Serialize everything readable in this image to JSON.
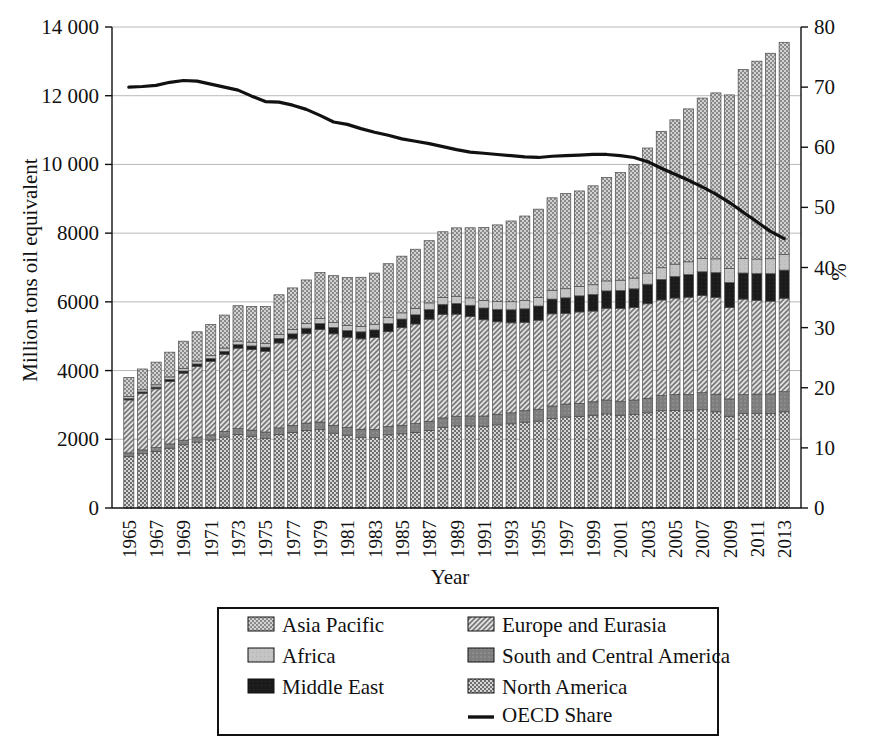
{
  "chart_data": {
    "type": "bar",
    "title": "",
    "subtitle": "",
    "xlabel": "Year",
    "ylabel": "Million tons oil equivalent",
    "y2label": "%",
    "grid": true,
    "legend_position": "bottom",
    "ylim": [
      0,
      14000
    ],
    "y2lim": [
      0,
      80
    ],
    "yticks": [
      "0",
      "2000",
      "4000",
      "6000",
      "8000",
      "10 000",
      "12 000",
      "14 000"
    ],
    "ytick_values": [
      0,
      2000,
      4000,
      6000,
      8000,
      10000,
      12000,
      14000
    ],
    "y2ticks": [
      "0",
      "10",
      "20",
      "30",
      "40",
      "50",
      "60",
      "70",
      "80"
    ],
    "y2tick_values": [
      0,
      10,
      20,
      30,
      40,
      50,
      60,
      70,
      80
    ],
    "x": [
      1965,
      1966,
      1967,
      1968,
      1969,
      1970,
      1971,
      1972,
      1973,
      1974,
      1975,
      1976,
      1977,
      1978,
      1979,
      1980,
      1981,
      1982,
      1983,
      1984,
      1985,
      1986,
      1987,
      1988,
      1989,
      1990,
      1991,
      1992,
      1993,
      1994,
      1995,
      1996,
      1997,
      1998,
      1999,
      2000,
      2001,
      2002,
      2003,
      2004,
      2005,
      2006,
      2007,
      2008,
      2009,
      2010,
      2011,
      2012,
      2013
    ],
    "xtick_labels": [
      "1965",
      "1967",
      "1969",
      "1971",
      "1973",
      "1975",
      "1977",
      "1979",
      "1981",
      "1983",
      "1985",
      "1987",
      "1989",
      "1991",
      "1993",
      "1995",
      "1997",
      "1999",
      "2001",
      "2003",
      "2005",
      "2007",
      "2009",
      "2011",
      "2013"
    ],
    "stack_order_bottom_to_top": [
      "North America",
      "South and Central America",
      "Europe and Eurasia",
      "Middle East",
      "Africa",
      "Asia Pacific"
    ],
    "series": [
      {
        "name": "North America",
        "pattern": "checker",
        "color": "#8f8f8f",
        "values": [
          1500,
          1580,
          1640,
          1740,
          1840,
          1920,
          1980,
          2070,
          2140,
          2090,
          2030,
          2140,
          2200,
          2260,
          2280,
          2180,
          2120,
          2060,
          2050,
          2130,
          2160,
          2200,
          2260,
          2350,
          2390,
          2390,
          2380,
          2420,
          2450,
          2500,
          2530,
          2610,
          2650,
          2660,
          2700,
          2740,
          2700,
          2730,
          2770,
          2830,
          2840,
          2830,
          2860,
          2800,
          2670,
          2760,
          2760,
          2750,
          2800
        ]
      },
      {
        "name": "South and Central America",
        "pattern": "solid-dark",
        "color": "#7d7d7d",
        "values": [
          105,
          112,
          118,
          126,
          134,
          142,
          150,
          160,
          172,
          178,
          182,
          192,
          202,
          212,
          224,
          228,
          230,
          232,
          234,
          242,
          248,
          256,
          264,
          272,
          282,
          290,
          298,
          310,
          320,
          332,
          346,
          360,
          376,
          386,
          392,
          404,
          408,
          414,
          424,
          444,
          460,
          476,
          496,
          512,
          506,
          540,
          556,
          570,
          585
        ]
      },
      {
        "name": "Europe and Eurasia",
        "pattern": "diagonal",
        "color": "#c9c9c9",
        "values": [
          1540,
          1640,
          1710,
          1820,
          1950,
          2060,
          2140,
          2240,
          2340,
          2340,
          2350,
          2470,
          2520,
          2600,
          2690,
          2660,
          2620,
          2630,
          2680,
          2760,
          2840,
          2900,
          2970,
          3010,
          2970,
          2890,
          2800,
          2690,
          2620,
          2570,
          2590,
          2680,
          2640,
          2660,
          2640,
          2670,
          2700,
          2690,
          2750,
          2780,
          2810,
          2830,
          2830,
          2820,
          2660,
          2780,
          2730,
          2700,
          2720
        ]
      },
      {
        "name": "Middle East",
        "pattern": "solid-black",
        "color": "#1c1c1c",
        "values": [
          42,
          47,
          52,
          58,
          64,
          72,
          80,
          90,
          102,
          110,
          120,
          134,
          148,
          162,
          176,
          186,
          196,
          206,
          220,
          236,
          252,
          268,
          282,
          296,
          312,
          330,
          344,
          362,
          380,
          396,
          414,
          432,
          452,
          470,
          486,
          506,
          524,
          546,
          570,
          600,
          632,
          660,
          690,
          720,
          730,
          760,
          780,
          800,
          820
        ]
      },
      {
        "name": "Africa",
        "pattern": "light-gray",
        "color": "#c2c2c2",
        "values": [
          58,
          62,
          66,
          72,
          78,
          84,
          90,
          96,
          104,
          108,
          112,
          120,
          126,
          134,
          142,
          148,
          152,
          158,
          164,
          172,
          180,
          188,
          194,
          202,
          210,
          216,
          222,
          228,
          234,
          240,
          248,
          256,
          264,
          272,
          280,
          290,
          300,
          312,
          324,
          340,
          356,
          370,
          386,
          400,
          408,
          424,
          420,
          436,
          450
        ]
      },
      {
        "name": "Asia Pacific",
        "pattern": "dotted",
        "color": "#b0b0b0",
        "values": [
          555,
          605,
          660,
          720,
          790,
          850,
          900,
          960,
          1030,
          1040,
          1070,
          1150,
          1210,
          1270,
          1340,
          1360,
          1390,
          1430,
          1490,
          1570,
          1650,
          1720,
          1810,
          1910,
          1990,
          2040,
          2120,
          2230,
          2350,
          2460,
          2570,
          2690,
          2770,
          2780,
          2880,
          3010,
          3130,
          3310,
          3640,
          3970,
          4200,
          4450,
          4670,
          4830,
          5050,
          5500,
          5760,
          5980,
          6180
        ]
      }
    ],
    "line_series": {
      "name": "OECD Share",
      "unit": "%",
      "axis": "right",
      "values": [
        70.0,
        70.1,
        70.3,
        70.8,
        71.1,
        71.0,
        70.5,
        70.0,
        69.5,
        68.5,
        67.6,
        67.5,
        67.0,
        66.3,
        65.3,
        64.2,
        63.8,
        63.1,
        62.5,
        62.0,
        61.4,
        61.0,
        60.6,
        60.1,
        59.6,
        59.2,
        59.0,
        58.8,
        58.6,
        58.4,
        58.3,
        58.5,
        58.6,
        58.7,
        58.8,
        58.8,
        58.6,
        58.3,
        57.6,
        56.5,
        55.5,
        54.5,
        53.4,
        52.2,
        50.8,
        49.2,
        47.6,
        46.0,
        44.8
      ]
    }
  },
  "legend": {
    "items": [
      {
        "label": "Asia Pacific",
        "marker": "swatch",
        "pattern": "dotted"
      },
      {
        "label": "Europe and Eurasia",
        "marker": "swatch",
        "pattern": "diagonal"
      },
      {
        "label": "Africa",
        "marker": "swatch",
        "pattern": "light-gray"
      },
      {
        "label": "South and Central America",
        "marker": "swatch",
        "pattern": "solid-dark"
      },
      {
        "label": "Middle East",
        "marker": "swatch",
        "pattern": "solid-black"
      },
      {
        "label": "North America",
        "marker": "swatch",
        "pattern": "checker"
      },
      {
        "label": "OECD Share",
        "marker": "line",
        "pattern": "line"
      }
    ]
  },
  "colors": {
    "grid": "#b9b9b9",
    "axis": "#111111",
    "line": "#111111",
    "background": "#ffffff"
  }
}
